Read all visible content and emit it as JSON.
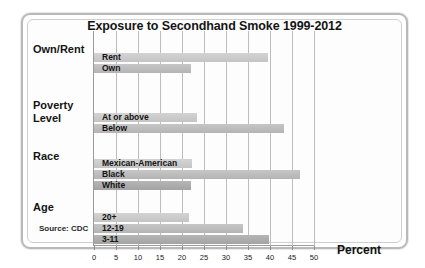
{
  "chart_data": {
    "type": "bar",
    "orientation": "horizontal",
    "title": "Exposure to Secondhand Smoke 1999-2012",
    "xlabel": "Percent",
    "ylabel": "",
    "xlim": [
      0,
      50
    ],
    "xticks": [
      0,
      5,
      10,
      15,
      20,
      25,
      30,
      35,
      40,
      45,
      50
    ],
    "xtick_labels": [
      "0",
      "5",
      "10",
      "15",
      "20",
      "25",
      "30",
      "35",
      "40",
      "45",
      "50"
    ],
    "grid": true,
    "legend": "none",
    "source": "Source: CDC",
    "groups": [
      {
        "name": "Own/Rent",
        "bars": [
          {
            "label": "Rent",
            "value": 39.5
          },
          {
            "label": "Own",
            "value": 22.0
          }
        ]
      },
      {
        "name": "Poverty Level",
        "name_line1": "Poverty",
        "name_line2": "Level",
        "bars": [
          {
            "label": "At or above",
            "value": 23.4
          },
          {
            "label": "Below",
            "value": 43.2
          }
        ]
      },
      {
        "name": "Race",
        "bars": [
          {
            "label": "Mexican-American",
            "value": 22.3
          },
          {
            "label": "Black",
            "value": 46.8
          },
          {
            "label": "White",
            "value": 22.0
          }
        ]
      },
      {
        "name": "Age",
        "bars": [
          {
            "label": "20+",
            "value": 21.6
          },
          {
            "label": "12-19",
            "value": 33.9
          },
          {
            "label": "3-11",
            "value": 39.8
          }
        ]
      }
    ]
  },
  "colors": {
    "bar_light": "#d3d3d3",
    "bar_mid": "#c0c0c0",
    "bar_dark": "#ababab",
    "gridline": "#bcbcbc",
    "frame": "#b9b9b9",
    "text": "#141414"
  }
}
